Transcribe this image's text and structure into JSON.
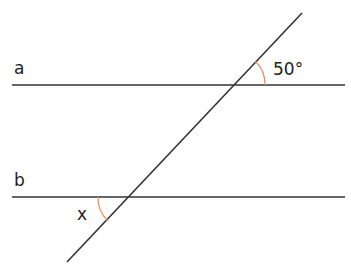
{
  "diagram": {
    "type": "parallel-lines-transversal",
    "lines": [
      {
        "id": "a",
        "label": "a",
        "y": 85,
        "x1": 12,
        "x2": 345
      },
      {
        "id": "b",
        "label": "b",
        "y": 197,
        "x1": 12,
        "x2": 345
      }
    ],
    "transversal": {
      "x1": 302,
      "y1": 13,
      "x2": 67,
      "y2": 262
    },
    "angles": [
      {
        "label": "50°",
        "at_line": "a",
        "position": "upper-right",
        "color": "#e8916a"
      },
      {
        "label": "x",
        "at_line": "b",
        "position": "lower-left",
        "color": "#e8916a"
      }
    ],
    "line_color": "#333333"
  }
}
